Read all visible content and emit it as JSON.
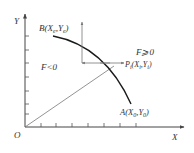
{
  "diagram": {
    "axes": {
      "x_label": "X",
      "y_label": "Y",
      "origin_label": "O"
    },
    "points": {
      "B": {
        "name": "B",
        "coord_x": "X",
        "coord_x_sub": "e",
        "coord_y": "Y",
        "coord_y_sub": "e"
      },
      "A": {
        "name": "A",
        "coord_x": "X",
        "coord_x_sub": "0",
        "coord_y": "Y",
        "coord_y_sub": "0"
      },
      "P": {
        "name": "P",
        "name_sub": "i",
        "coord_x": "X",
        "coord_x_sub": "i",
        "coord_y": "Y",
        "coord_y_sub": "i"
      }
    },
    "regions": {
      "inside": "F<0",
      "outside": "F⩾0"
    },
    "colors": {
      "line": "#333333",
      "curve": "#1a1a1a",
      "guide": "#777777"
    }
  }
}
